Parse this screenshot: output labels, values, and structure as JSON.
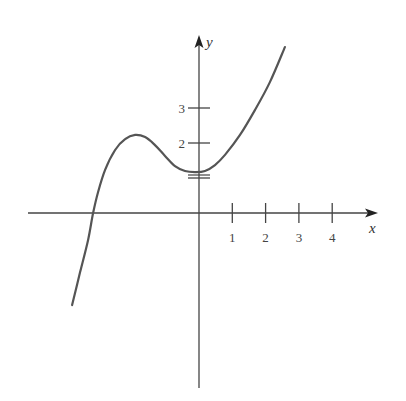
{
  "chart_data": {
    "type": "line",
    "title": "",
    "xlabel": "x",
    "ylabel": "y",
    "x_ticks": [
      1,
      2,
      3,
      4
    ],
    "y_ticks": [
      1,
      2,
      3
    ],
    "y_tick_labels": [
      {
        "value": 2,
        "label": "2"
      },
      {
        "value": 3,
        "label": "3"
      }
    ],
    "x_tick_labels": [
      {
        "value": 1,
        "label": "1"
      },
      {
        "value": 2,
        "label": "2"
      },
      {
        "value": 3,
        "label": "3"
      },
      {
        "value": 4,
        "label": "4"
      }
    ],
    "xlim": [
      -5.1,
      5.3
    ],
    "ylim": [
      -5.1,
      4.9
    ],
    "grid": false,
    "legend": null,
    "series": [
      {
        "name": "curve",
        "color": "#555555",
        "points": [
          [
            -3.81,
            -2.63
          ],
          [
            -3.57,
            -1.69
          ],
          [
            -3.33,
            -0.77
          ],
          [
            -3.18,
            0.0
          ],
          [
            -3.03,
            0.6
          ],
          [
            -2.82,
            1.23
          ],
          [
            -2.52,
            1.8
          ],
          [
            -2.22,
            2.11
          ],
          [
            -1.92,
            2.23
          ],
          [
            -1.62,
            2.17
          ],
          [
            -1.32,
            1.94
          ],
          [
            -1.02,
            1.63
          ],
          [
            -0.72,
            1.34
          ],
          [
            -0.42,
            1.2
          ],
          [
            -0.12,
            1.17
          ],
          [
            0.18,
            1.2
          ],
          [
            0.48,
            1.37
          ],
          [
            0.78,
            1.66
          ],
          [
            1.23,
            2.23
          ],
          [
            1.68,
            2.94
          ],
          [
            2.13,
            3.74
          ],
          [
            2.58,
            4.74
          ]
        ]
      }
    ],
    "annotations": [
      "local maximum near x≈-1.9, y≈2.2",
      "local minimum near x≈-0.1, y≈1.17",
      "x-intercept near x≈-3.2",
      "y-intercept near y≈1.2"
    ]
  },
  "layout": {
    "origin_px": [
      199,
      213
    ],
    "x_unit_px": 33.3,
    "y_unit_px": 35,
    "x_axis_px": [
      28,
      378
    ],
    "y_axis_px": [
      388,
      35
    ],
    "axis_color": "#444444",
    "curve_color": "#555555"
  }
}
